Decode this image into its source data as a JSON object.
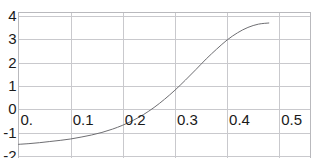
{
  "figure": {
    "top_clipped_text": "' ' ' ' ' ' '   ' ' '   ' '  ' '   ' ' '",
    "frame_color": "#b9b9bd",
    "grid_color": "#c9c9cd",
    "curve_color": "#6e6e72",
    "background": "#ffffff"
  },
  "chart_data": {
    "type": "line",
    "title": "",
    "xlabel": "",
    "ylabel": "",
    "xlim": [
      0.0,
      0.56
    ],
    "ylim": [
      -2.0,
      4.0
    ],
    "grid": true,
    "legend": null,
    "xticks": [
      0.0,
      0.1,
      0.2,
      0.3,
      0.4,
      0.5
    ],
    "xticklabels": [
      "0.",
      "0.1",
      "0.2",
      "0.3",
      "0.4",
      "0.5"
    ],
    "yticks": [
      -2,
      -1,
      0,
      1,
      2,
      3,
      4
    ],
    "yticklabels": [
      "-2",
      "-1",
      "0",
      "1",
      "2",
      "3",
      "4"
    ],
    "series": [
      {
        "name": "curve",
        "x": [
          0.0,
          0.02,
          0.04,
          0.06,
          0.08,
          0.1,
          0.12,
          0.14,
          0.16,
          0.18,
          0.2,
          0.22,
          0.24,
          0.26,
          0.28,
          0.3,
          0.32,
          0.34,
          0.36,
          0.38,
          0.4,
          0.42,
          0.44,
          0.46,
          0.48
        ],
        "y": [
          -1.5,
          -1.47,
          -1.43,
          -1.38,
          -1.33,
          -1.27,
          -1.19,
          -1.1,
          -0.99,
          -0.85,
          -0.68,
          -0.47,
          -0.22,
          0.08,
          0.43,
          0.82,
          1.25,
          1.7,
          2.16,
          2.58,
          2.97,
          3.28,
          3.51,
          3.65,
          3.7
        ]
      }
    ]
  }
}
